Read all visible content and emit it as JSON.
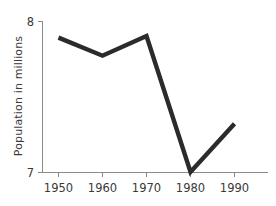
{
  "chart_data": {
    "type": "line",
    "title": "",
    "subtitle": "",
    "xlabel": "",
    "ylabel": "Population in millions",
    "x": [
      1950,
      1960,
      1970,
      1980,
      1990
    ],
    "xtick_labels": [
      "1950",
      "1960",
      "1970",
      "1980",
      "1990"
    ],
    "values": [
      7.89,
      7.77,
      7.9,
      7.0,
      7.32
    ],
    "series": [
      {
        "name": "Population",
        "values": [
          7.89,
          7.77,
          7.9,
          7.0,
          7.32
        ]
      }
    ],
    "ytick_labels": [
      "8",
      "7"
    ],
    "yticks": [
      8,
      7
    ],
    "xlim": [
      1945,
      1995
    ],
    "ylim": [
      7,
      8
    ],
    "grid": false,
    "legend": false,
    "legend_position": "none",
    "line_color": "#2b2b2b",
    "axis_color": "#8a8a8a",
    "background_color": "#ffffff",
    "annotations": []
  },
  "axes": {
    "y_top_label": "8",
    "y_bottom_label": "7",
    "y_axis_title": "Population in millions"
  },
  "xaxis": {
    "labels": [
      "1950",
      "1960",
      "1970",
      "1980",
      "1990"
    ]
  }
}
